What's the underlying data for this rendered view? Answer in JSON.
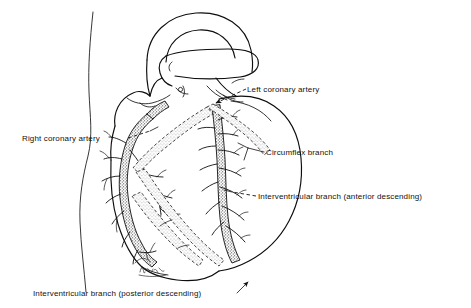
{
  "figure": {
    "background_color": "#ffffff",
    "ink_color": "#111111",
    "width": 471,
    "height": 308
  },
  "labels": [
    {
      "id": "left-coronary-artery",
      "text": "Left coronary artery",
      "x": 247,
      "y": 92,
      "anchor": "start",
      "leader": "arrow"
    },
    {
      "id": "right-coronary-artery",
      "text": "Right coronary artery",
      "x": 22,
      "y": 141,
      "anchor": "start",
      "leader": "dashed"
    },
    {
      "id": "circumflex-branch",
      "text": "Circumflex branch",
      "x": 266,
      "y": 155,
      "anchor": "start",
      "leader": "line"
    },
    {
      "id": "interventricular-branch-anterior",
      "text": "Interventricular branch (anterior descending)",
      "x": 258,
      "y": 199,
      "anchor": "start",
      "leader": "dashed"
    },
    {
      "id": "interventricular-branch-posterior",
      "text": "Interventricular branch (posterior descending)",
      "x": 33,
      "y": 296,
      "anchor": "start",
      "leader": "arrow"
    }
  ],
  "structures": {
    "aortic_arch": "aortic-arch",
    "pulmonary_trunk": "pulmonary-trunk",
    "superior_vena_cava": "superior-vena-cava",
    "right_atrium": "right-atrium",
    "right_ventricle": "right-ventricle",
    "left_ventricle": "left-ventricle",
    "left_atrial_appendage": "left-atrial-appendage",
    "apex": "cardiac-apex"
  },
  "artist_signature": {
    "present": true,
    "name": "signature-mark"
  }
}
